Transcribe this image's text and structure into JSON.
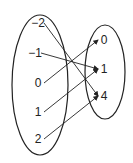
{
  "diagram": {
    "type": "mapping",
    "domain": {
      "labels": [
        "−2",
        "−1",
        "0",
        "1",
        "2"
      ],
      "positions": [
        [
          38,
          27
        ],
        [
          35,
          57
        ],
        [
          38,
          87
        ],
        [
          38,
          116
        ],
        [
          38,
          143
        ]
      ]
    },
    "range": {
      "labels": [
        "0",
        "1",
        "4"
      ],
      "positions": [
        [
          104,
          44
        ],
        [
          104,
          73
        ],
        [
          104,
          100
        ]
      ]
    },
    "mappings": [
      {
        "from": 0,
        "to": 2
      },
      {
        "from": 1,
        "to": 1
      },
      {
        "from": 2,
        "to": 0
      },
      {
        "from": 3,
        "to": 1
      },
      {
        "from": 4,
        "to": 2
      }
    ],
    "colors": {
      "stroke": "#222222",
      "background": "#ffffff"
    }
  }
}
